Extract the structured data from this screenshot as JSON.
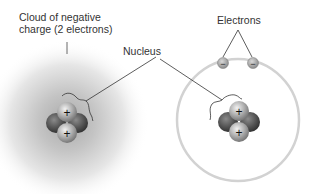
{
  "labels": {
    "cloud_line1": "Cloud of negative",
    "cloud_line2": "charge (2 electrons)",
    "nucleus": "Nucleus",
    "electrons": "Electrons"
  },
  "symbols": {
    "proton": "+",
    "electron": "−"
  },
  "colors": {
    "cloud": "#b8b8b8",
    "orbit": "#d4d4d4",
    "proton": "#a8a8a8",
    "neutron": "#5a5a5a",
    "electron": "#9a9a9a",
    "line": "#333333"
  }
}
